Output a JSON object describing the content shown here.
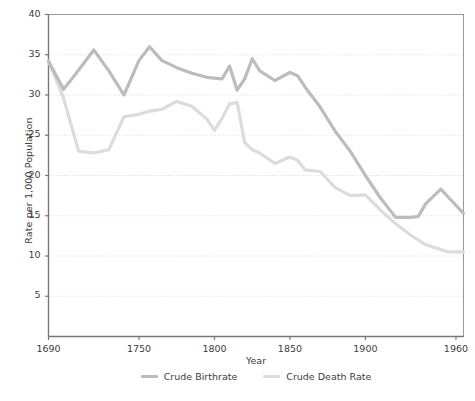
{
  "chart_data": {
    "type": "line",
    "title": "",
    "xlabel": "Year",
    "ylabel": "Rate per 1,000 Population",
    "xlim": [
      1690,
      1965
    ],
    "ylim": [
      0,
      40
    ],
    "yticks": [
      5,
      10,
      15,
      20,
      25,
      30,
      35,
      40
    ],
    "xticks": [
      1690,
      1750,
      1800,
      1850,
      1900,
      1960
    ],
    "grid": true,
    "legend_position": "bottom-center",
    "colors": {
      "crude_birthrate": "#bcbcbc",
      "crude_death_rate": "#dcdcdc",
      "axis": "#808080",
      "gridline": "#d9d9d9",
      "text": "#3c3c3c",
      "background": "#ffffff"
    },
    "series": [
      {
        "name": "Crude Birthrate",
        "color": "#bcbcbc",
        "x": [
          1690,
          1700,
          1710,
          1720,
          1730,
          1740,
          1750,
          1757,
          1765,
          1775,
          1785,
          1795,
          1800,
          1805,
          1810,
          1815,
          1820,
          1825,
          1830,
          1840,
          1850,
          1855,
          1860,
          1870,
          1880,
          1890,
          1900,
          1910,
          1920,
          1930,
          1935,
          1940,
          1950,
          1955,
          1965
        ],
        "y": [
          34.2,
          30.7,
          33.1,
          35.6,
          33.0,
          30.0,
          34.3,
          36.0,
          34.3,
          33.4,
          32.7,
          32.2,
          32.1,
          32.0,
          33.6,
          30.6,
          32.0,
          34.5,
          33.0,
          31.8,
          32.8,
          32.4,
          31.0,
          28.5,
          25.5,
          23.0,
          20.0,
          17.2,
          14.8,
          14.8,
          14.9,
          16.5,
          18.3,
          17.3,
          15.3
        ]
      },
      {
        "name": "Crude Death Rate",
        "color": "#dcdcdc",
        "x": [
          1690,
          1700,
          1710,
          1720,
          1730,
          1740,
          1750,
          1757,
          1765,
          1775,
          1785,
          1795,
          1800,
          1805,
          1810,
          1815,
          1820,
          1825,
          1830,
          1840,
          1850,
          1855,
          1860,
          1870,
          1880,
          1890,
          1900,
          1910,
          1920,
          1930,
          1940,
          1950,
          1955,
          1965
        ],
        "y": [
          34.2,
          29.6,
          23.0,
          22.8,
          23.2,
          27.3,
          27.6,
          28.0,
          28.2,
          29.2,
          28.6,
          27.0,
          25.6,
          27.1,
          28.9,
          29.1,
          24.1,
          23.2,
          22.8,
          21.5,
          22.3,
          21.9,
          20.7,
          20.5,
          18.5,
          17.5,
          17.6,
          15.7,
          14.0,
          12.6,
          11.4,
          10.8,
          10.5,
          10.5
        ]
      }
    ]
  },
  "axis": {
    "y_title": "Rate per 1,000 Population",
    "x_title": "Year",
    "ytick_labels": [
      "40",
      "35",
      "30",
      "25",
      "20",
      "15",
      "10",
      "5"
    ],
    "xtick_labels": [
      "1690",
      "1750",
      "1800",
      "1850",
      "1900",
      "1960"
    ]
  },
  "legend": {
    "items": [
      {
        "label": "Crude Birthrate"
      },
      {
        "label": "Crude Death Rate"
      }
    ]
  }
}
